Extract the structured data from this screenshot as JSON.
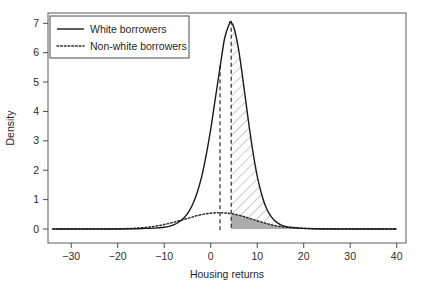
{
  "chart_data": {
    "type": "area",
    "title": "",
    "xlabel": "Housing returns",
    "ylabel": "Density",
    "xlim": [
      -35,
      42
    ],
    "ylim": [
      0,
      7.35
    ],
    "grid": false,
    "legend_position": "top-left",
    "xticks": [
      -30,
      -20,
      -10,
      0,
      10,
      20,
      30,
      40
    ],
    "xtick_labels": [
      "−30",
      "−20",
      "−10",
      "0",
      "10",
      "20",
      "30",
      "40"
    ],
    "yticks": [
      0,
      1,
      2,
      3,
      4,
      5,
      6,
      7
    ],
    "ytick_labels": [
      "0",
      "1",
      "2",
      "3",
      "4",
      "5",
      "6",
      "7"
    ],
    "series": [
      {
        "name": "White borrowers",
        "style": "solid",
        "color": "#1a1a1a",
        "distribution": "normal",
        "mean": 4.3,
        "sd": 2.5,
        "peak_density": 7.05,
        "x": [
          -34,
          -30,
          -25,
          -20,
          -16,
          -14,
          -12,
          -10,
          -9,
          -8,
          -7,
          -6,
          -5,
          -4,
          -3,
          -2,
          -1,
          0,
          1,
          2,
          2.2,
          3,
          4,
          4.3,
          5,
          6,
          7,
          8,
          9,
          10,
          11,
          12,
          13,
          14,
          15,
          16,
          17,
          18,
          19,
          20,
          22,
          25,
          30,
          35,
          40
        ],
        "y": [
          0,
          0,
          0,
          0,
          0.01,
          0.02,
          0.03,
          0.06,
          0.09,
          0.14,
          0.22,
          0.34,
          0.52,
          0.8,
          1.2,
          1.75,
          2.5,
          3.4,
          4.45,
          5.5,
          5.7,
          6.5,
          6.98,
          7.05,
          6.85,
          6.1,
          5.0,
          3.8,
          2.7,
          1.8,
          1.15,
          0.7,
          0.42,
          0.25,
          0.15,
          0.09,
          0.06,
          0.04,
          0.03,
          0.02,
          0.01,
          0,
          0,
          0,
          0
        ]
      },
      {
        "name": "Non-white borrowers",
        "style": "dotted",
        "color": "#2b2b2b",
        "distribution": "normal",
        "mean": 2.0,
        "sd": 7.0,
        "peak_density": 0.55,
        "x": [
          -34,
          -30,
          -25,
          -20,
          -17,
          -15,
          -13,
          -11,
          -9,
          -7,
          -5,
          -3,
          -1,
          0,
          1,
          2,
          3,
          4,
          5,
          6,
          7,
          8,
          9,
          10,
          11,
          12,
          13,
          14,
          15,
          16,
          17,
          18,
          19,
          20,
          22,
          25,
          30,
          35,
          40
        ],
        "y": [
          0,
          0,
          0,
          0.005,
          0.02,
          0.04,
          0.07,
          0.12,
          0.19,
          0.27,
          0.36,
          0.45,
          0.52,
          0.54,
          0.55,
          0.55,
          0.545,
          0.53,
          0.51,
          0.47,
          0.43,
          0.38,
          0.33,
          0.28,
          0.23,
          0.185,
          0.145,
          0.11,
          0.085,
          0.065,
          0.05,
          0.038,
          0.028,
          0.021,
          0.012,
          0.005,
          0.001,
          0,
          0
        ]
      }
    ],
    "annotations": [
      {
        "name": "vline-left",
        "type": "vertical-dashed-line",
        "x": 2.0,
        "style": "dashed",
        "color": "#1a1a1a"
      },
      {
        "name": "vline-right",
        "type": "vertical-dashed-line",
        "x": 4.4,
        "style": "dashed",
        "color": "#1a1a1a"
      },
      {
        "name": "hatched-region",
        "type": "hatched-fill",
        "x_start": 4.4,
        "x_end": 21,
        "between": [
          "White borrowers",
          "Non-white borrowers"
        ],
        "pattern": "diagonal-hatch",
        "color": "#8a8a8a"
      },
      {
        "name": "shaded-region",
        "type": "solid-fill",
        "x_start": 4.4,
        "x_end": 18,
        "under": "Non-white borrowers",
        "color": "#9e9e9e",
        "opacity": 0.8
      }
    ]
  },
  "legend": {
    "items": [
      {
        "label": "White borrowers",
        "style": "solid"
      },
      {
        "label": "Non-white borrowers",
        "style": "dotted"
      }
    ]
  },
  "axes": {
    "x_title": "Housing returns",
    "y_title": "Density"
  }
}
